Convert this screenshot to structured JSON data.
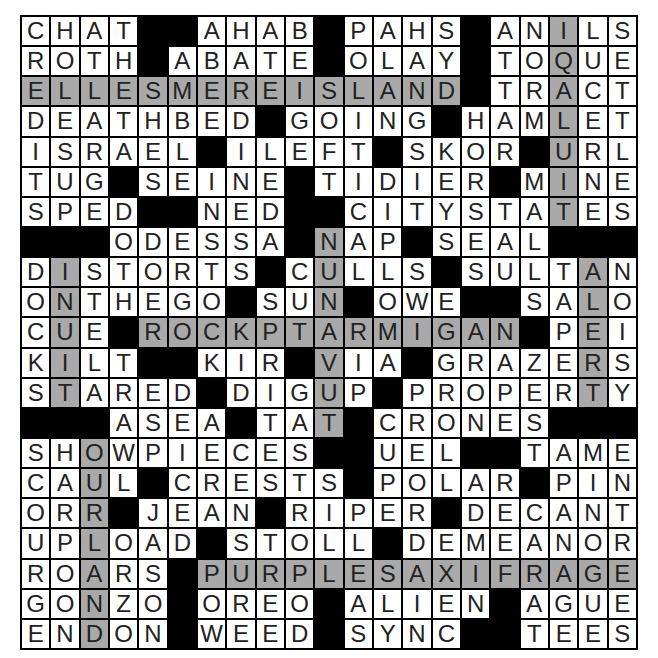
{
  "puzzle": {
    "rows": 21,
    "cols": 21,
    "block_char": "#",
    "grid": [
      "CHAT##AHAB#PAHS#ANILS",
      "ROTH#ABATE#OLAY#TOQUE",
      "ELLESMEREISLAND#TRACT",
      "DEATHBED#GOING#HAMLET",
      "ISRAEL#ILEFT#SKOR#URL",
      "TUG#SEINE#TIDIER#MINE",
      "SPED##NED##CITYSTATES",
      "###ODESSA#NAP#SEAL###",
      "DISTORTS#CULLS#SULTAN",
      "ONTHEGO#SUN#OWE##SALO",
      "CUE#ROCKPTARMIGAN#PEI",
      "KILT##KIR#VIA#GRAZERS",
      "STARED#DIGUP#PROPERTY",
      "###ASEA#TAT#CRONES###",
      "SHOWPIECES##UEL##TAME",
      "CAUL#CRESTS#POLAR#PIN",
      "ORR#JEAN#RIPER#DECANT",
      "UPLOAD#STOLL#DEMEANOR",
      "ROARS#PURPLESAXIFRAGE",
      "GONZO#OREO#ALIEN#AGUE",
      "ENDON#WEED#SYNC##TEES"
    ],
    "shaded": [
      "..................X..",
      "..................X..",
      "XXXXXXXXXXXXXXX...X..",
      "..................X..",
      "..................X..",
      "..................X..",
      "..................X..",
      "..........X..........",
      ".X........X........X.",
      ".X........X........X.",
      ".X..XXXXXXXXXXXXX..X.",
      ".X........X........X.",
      ".X........X........X.",
      "..........X..........",
      "..X..................",
      "..X..................",
      "..X..................",
      "..X..................",
      "..X...XXXXXXXXXXXXXXX",
      "..X..................",
      "..X.................."
    ],
    "shaded_entries": [
      "ELLESMEREISLAND",
      "IQALUIT",
      "NUNAVUT",
      "INUIT",
      "ALERT",
      "ROCKPTARMIGAN",
      "OURLAND",
      "PURPLESAXIFRAGE"
    ]
  },
  "colors": {
    "block": "#000000",
    "cell": "#ffffff",
    "shaded": "#a9a9a9",
    "letter": "#222222"
  }
}
